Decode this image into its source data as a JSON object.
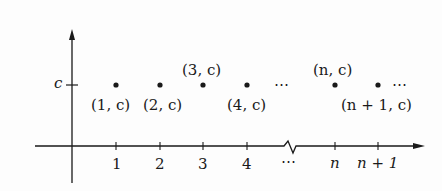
{
  "diagram": {
    "type": "constant-sequence-plot",
    "y_axis_label": "c",
    "x_axis_ticks": [
      {
        "label": "1",
        "x": 116
      },
      {
        "label": "2",
        "x": 160
      },
      {
        "label": "3",
        "x": 203
      },
      {
        "label": "4",
        "x": 247
      },
      {
        "label": "⋯",
        "x": 292
      },
      {
        "label": "n",
        "x": 335
      },
      {
        "label": "n + 1",
        "x": 378
      }
    ],
    "points": [
      {
        "label": "(1, c)",
        "x": 116,
        "label_pos": "below"
      },
      {
        "label": "(2, c)",
        "x": 160,
        "label_pos": "below"
      },
      {
        "label": "(3, c)",
        "x": 203,
        "label_pos": "above"
      },
      {
        "label": "(4, c)",
        "x": 247,
        "label_pos": "below"
      },
      {
        "label": "(n, c)",
        "x": 335,
        "label_pos": "above"
      },
      {
        "label": "(n + 1, c)",
        "x": 378,
        "label_pos": "below"
      }
    ],
    "ellipses": [
      {
        "text": "⋯",
        "x": 287,
        "y": 85
      },
      {
        "text": "⋯",
        "x": 398,
        "y": 85
      }
    ],
    "colors": {
      "ink": "#1a1a1a",
      "background": "#fdfdfd"
    }
  },
  "labels": {
    "c_axis": "c",
    "tick_1": "1",
    "tick_2": "2",
    "tick_3": "3",
    "tick_4": "4",
    "tick_dots": "⋯",
    "tick_n": "n",
    "tick_n1": "n + 1",
    "pt_1": "(1, c)",
    "pt_2": "(2, c)",
    "pt_3": "(3, c)",
    "pt_4": "(4, c)",
    "pt_n": "(n, c)",
    "pt_n1": "(n + 1, c)",
    "ellipsis_mid": "⋯",
    "ellipsis_end": "⋯"
  }
}
